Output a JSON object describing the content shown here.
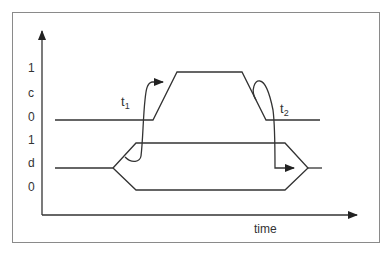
{
  "diagram": {
    "type": "timing-diagram",
    "y_axis_labels": [
      {
        "text": "1",
        "signal": "c",
        "level": "high"
      },
      {
        "text": "c",
        "signal": "c",
        "level": "name"
      },
      {
        "text": "0",
        "signal": "c",
        "level": "low"
      },
      {
        "text": "1",
        "signal": "d",
        "level": "high"
      },
      {
        "text": "d",
        "signal": "d",
        "level": "name"
      },
      {
        "text": "0",
        "signal": "d",
        "level": "low"
      }
    ],
    "x_axis_label": "time",
    "annotations": [
      {
        "id": "t1",
        "base": "t",
        "sub": "1",
        "description": "setup: d must be valid before c rising edge"
      },
      {
        "id": "t2",
        "base": "t",
        "sub": "2",
        "description": "hold: d must remain valid after c falling edge"
      }
    ],
    "signals": [
      {
        "name": "c",
        "kind": "clock",
        "sequence": [
          "0",
          "rise",
          "1",
          "fall",
          "0"
        ]
      },
      {
        "name": "d",
        "kind": "data-bus",
        "sequence": [
          "undefined",
          "valid (0 or 1)",
          "undefined"
        ]
      }
    ],
    "colors": {
      "line": "#333333",
      "frame": "#8a8a8a",
      "text": "#333333"
    }
  }
}
